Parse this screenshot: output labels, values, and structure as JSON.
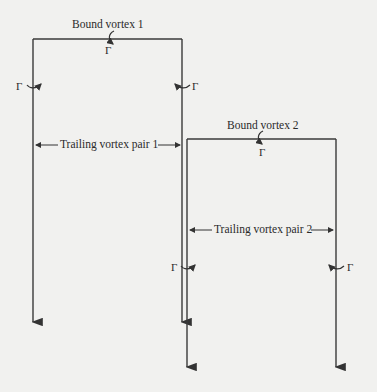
{
  "diagram": {
    "type": "horseshoe vortex system",
    "colors": {
      "line": "#3a3a3a",
      "background": "#f1f1ef"
    },
    "vortex_systems": [
      {
        "bound_vortex_label": "Bound vortex 1",
        "trailing_label": "Trailing vortex pair 1",
        "circulation_symbol": "Γ",
        "frame": {
          "left_x": 33,
          "right_x": 182,
          "top_y": 39,
          "left_bottom_y": 325,
          "right_bottom_y": 325
        }
      },
      {
        "bound_vortex_label": "Bound vortex 2",
        "trailing_label": "Trailing vortex pair 2",
        "circulation_symbol": "Γ",
        "frame": {
          "left_x": 187,
          "right_x": 336,
          "top_y": 139,
          "left_bottom_y": 370,
          "right_bottom_y": 370
        }
      }
    ],
    "gamma": "Γ"
  }
}
